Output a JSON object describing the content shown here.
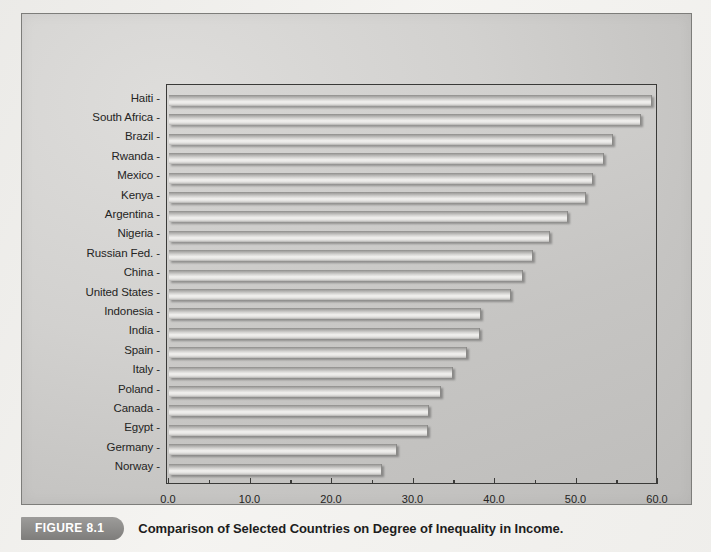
{
  "figure": {
    "badge_label": "FIGURE 8.1",
    "caption": "Comparison of Selected Countries on Degree of Inequality in Income."
  },
  "axis": {
    "x_ticks": [
      "0.0",
      "10.0",
      "20.0",
      "30.0",
      "40.0",
      "50.0",
      "60.0"
    ],
    "x_min": 0,
    "x_max": 60,
    "x_step": 10,
    "x_minor_step": 5
  },
  "colors": {
    "page_background": "#f4f3f0",
    "figure_background": "#d2d1cf",
    "plot_background": "#cfcecc",
    "plot_border": "#3a3a38",
    "bar_highlight": "#f2f1ef",
    "bar_shadow": "#8e8d8b",
    "text": "#242423",
    "badge_background": "#8c8b89",
    "badge_text": "#ffffff"
  },
  "chart_data": {
    "type": "bar",
    "orientation": "horizontal",
    "title": "Comparison of Selected Countries on Degree of Inequality in Income.",
    "xlabel": "",
    "ylabel": "",
    "xlim": [
      0,
      60
    ],
    "grid": false,
    "legend": null,
    "categories": [
      "Haiti",
      "South Africa",
      "Brazil",
      "Rwanda",
      "Mexico",
      "Kenya",
      "Argentina",
      "Nigeria",
      "Russian Fed.",
      "China",
      "United States",
      "Indonesia",
      "India",
      "Spain",
      "Italy",
      "Poland",
      "Canada",
      "Egypt",
      "Germany",
      "Norway"
    ],
    "values": [
      59.2,
      57.8,
      54.3,
      53.3,
      51.9,
      51.0,
      48.8,
      46.6,
      44.6,
      43.3,
      41.8,
      38.1,
      38.0,
      36.4,
      34.7,
      33.2,
      31.8,
      31.6,
      27.9,
      26.0
    ]
  }
}
